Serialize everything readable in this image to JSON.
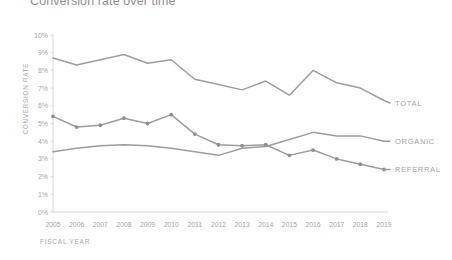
{
  "title": "Conversion rate over time",
  "axes": {
    "y_label": "CONVERSION RATE",
    "x_label": "FISCAL YEAR",
    "y_ticks": [
      "0%",
      "1%",
      "2%",
      "3%",
      "4%",
      "5%",
      "6%",
      "7%",
      "8%",
      "9%",
      "10%"
    ]
  },
  "colors": {
    "line": "#9d9d9d",
    "marker": "#8f8f8f",
    "axis": "#d5d5d5",
    "text": "#a5a5a5",
    "title": "#8f8f8f"
  },
  "chart_data": {
    "type": "line",
    "title": "Conversion rate over time",
    "xlabel": "FISCAL YEAR",
    "ylabel": "CONVERSION RATE",
    "ylim": [
      0,
      10
    ],
    "y_unit": "%",
    "grid": false,
    "legend_position": "right-inline",
    "categories": [
      "2005",
      "2006",
      "2007",
      "2008",
      "2009",
      "2010",
      "2011",
      "2012",
      "2013",
      "2014",
      "2015",
      "2016",
      "2017",
      "2018",
      "2019"
    ],
    "series": [
      {
        "name": "TOTAL",
        "markers": false,
        "values": [
          8.7,
          8.3,
          8.6,
          8.9,
          8.4,
          8.6,
          7.5,
          7.2,
          6.9,
          7.4,
          6.6,
          8.0,
          7.3,
          7.0,
          6.3
        ]
      },
      {
        "name": "ORGANIC",
        "markers": false,
        "values": [
          3.4,
          3.6,
          3.75,
          3.8,
          3.75,
          3.6,
          3.4,
          3.2,
          3.6,
          3.7,
          4.1,
          4.5,
          4.3,
          4.3,
          4.0
        ]
      },
      {
        "name": "REFERRAL",
        "markers": true,
        "values": [
          5.4,
          4.8,
          4.9,
          5.3,
          5.0,
          5.5,
          4.4,
          3.8,
          3.75,
          3.8,
          3.2,
          3.5,
          3.0,
          2.7,
          2.4
        ]
      }
    ]
  }
}
